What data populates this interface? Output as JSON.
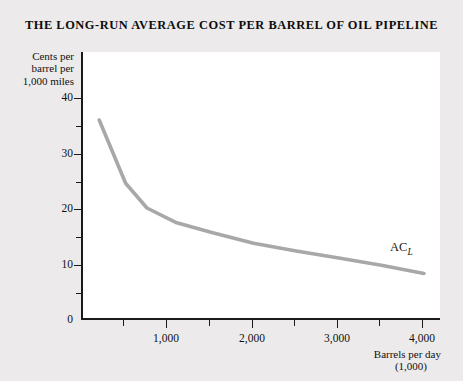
{
  "title": "THE LONG-RUN AVERAGE COST PER BARREL OF OIL PIPELINE",
  "axes": {
    "y_title_line1": "Cents per",
    "y_title_line2": "barrel per",
    "y_title_line3": "1,000 miles",
    "x_title_line1": "Barrels per day",
    "x_title_line2": "(1,000)"
  },
  "annotations": {
    "curve_label_base": "AC",
    "curve_label_sub": "L"
  },
  "colors": {
    "page_background": "#eceaea",
    "plot_background": "#ffffff",
    "axis": "#1a1a1a",
    "curve": "#a8a8a8",
    "text": "#111111"
  },
  "chart_data": {
    "type": "line",
    "title": "THE LONG-RUN AVERAGE COST PER BARREL OF OIL PIPELINE",
    "xlabel": "Barrels per day (1,000)",
    "ylabel": "Cents per barrel per 1,000 miles",
    "xlim": [
      0,
      4200
    ],
    "ylim": [
      0,
      44
    ],
    "grid": false,
    "legend": "none",
    "series": [
      {
        "name": "AC_L",
        "x": [
          190,
          500,
          750,
          1100,
          1500,
          2000,
          2500,
          3000,
          3500,
          4000
        ],
        "y": [
          36,
          24.5,
          20,
          17.3,
          15.6,
          13.6,
          12.2,
          10.9,
          9.6,
          8.1
        ]
      }
    ],
    "y_ticks_major": [
      0,
      10,
      20,
      30,
      40
    ],
    "y_ticks_minor": [
      5,
      15,
      25,
      35
    ],
    "y_tick_labels": [
      "0",
      "10",
      "20",
      "30",
      "40"
    ],
    "x_ticks_major": [
      1000,
      2000,
      3000,
      4000
    ],
    "x_ticks_minor": [
      500,
      1500,
      2500,
      3500
    ],
    "x_tick_labels": [
      "1,000",
      "2,000",
      "3,000",
      "4,000"
    ]
  }
}
